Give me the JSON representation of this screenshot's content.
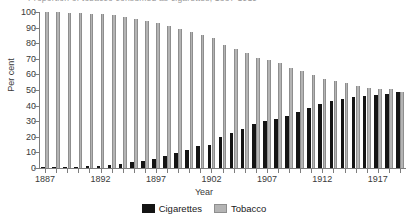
{
  "figure": {
    "partial_title": "Proportion of tobacco consumed as cigarettes, 1887-1919"
  },
  "chart_data": {
    "type": "bar",
    "title": "",
    "xlabel": "Year",
    "ylabel": "Per cent",
    "ylim": [
      0,
      100
    ],
    "ytick_labels": [
      "0",
      "10",
      "20",
      "30",
      "40",
      "50",
      "60",
      "70",
      "80",
      "90",
      "100"
    ],
    "ytick_values": [
      0,
      10,
      20,
      30,
      40,
      50,
      60,
      70,
      80,
      90,
      100
    ],
    "xtick_labels": [
      "1887",
      "1892",
      "1897",
      "1902",
      "1907",
      "1912",
      "1917"
    ],
    "xtick_values": [
      1887,
      1892,
      1897,
      1902,
      1907,
      1912,
      1917
    ],
    "grid": false,
    "legend_position": "bottom",
    "categories": [
      "1887",
      "1888",
      "1889",
      "1890",
      "1891",
      "1892",
      "1893",
      "1894",
      "1895",
      "1896",
      "1897",
      "1898",
      "1899",
      "1900",
      "1901",
      "1902",
      "1903",
      "1904",
      "1905",
      "1906",
      "1907",
      "1908",
      "1909",
      "1910",
      "1911",
      "1912",
      "1913",
      "1914",
      "1915",
      "1916",
      "1917",
      "1918",
      "1919"
    ],
    "series": [
      {
        "name": "Cigarettes",
        "color": "#141414",
        "values": [
          0.3,
          0.4,
          0.5,
          0.6,
          1.0,
          1.3,
          1.8,
          2.7,
          3.6,
          4.6,
          6.0,
          7.7,
          9.5,
          11.5,
          13.8,
          14.9,
          19.7,
          22.4,
          25.3,
          28.3,
          29.9,
          31.6,
          33.2,
          35.8,
          38.7,
          41.3,
          42.7,
          44.2,
          45.4,
          46.4,
          47.0,
          47.5,
          48.7
        ]
      },
      {
        "name": "Tobacco",
        "color": "#b4b4b4",
        "values": [
          100.0,
          99.7,
          99.6,
          99.5,
          99.0,
          98.7,
          98.2,
          96.8,
          95.4,
          94.2,
          93.0,
          91.0,
          89.2,
          87.2,
          85.0,
          83.5,
          79.0,
          76.3,
          73.5,
          70.7,
          69.0,
          67.0,
          64.3,
          62.5,
          59.8,
          57.0,
          55.7,
          54.3,
          52.6,
          51.3,
          50.7,
          50.6,
          49.0
        ]
      }
    ]
  },
  "legend": {
    "items": [
      {
        "label": "Cigarettes",
        "swatch": "black-square-icon"
      },
      {
        "label": "Tobacco",
        "swatch": "gray-square-icon"
      }
    ]
  }
}
